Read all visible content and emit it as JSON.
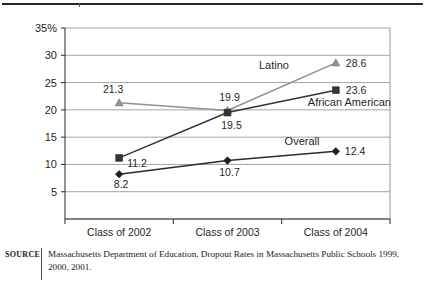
{
  "figure": {
    "source_tag": "SOURCE",
    "source_text": "Massachusetts Department of Education, Dropout Rates in Massachusetts Public Schools 1999, 2000, 2001."
  },
  "chart_data": {
    "type": "line",
    "title": "",
    "xlabel": "",
    "ylabel": "",
    "categories": [
      "Class of 2002",
      "Class of 2003",
      "Class of 2004"
    ],
    "series": [
      {
        "name": "Latino",
        "color": "#8f8f8f",
        "marker": "triangle",
        "values": [
          21.3,
          19.9,
          28.6
        ],
        "point_labels": [
          "21.3",
          "19.9",
          "28.6"
        ]
      },
      {
        "name": "African American",
        "color": "#333333",
        "marker": "square",
        "values": [
          11.2,
          19.5,
          23.6
        ],
        "point_labels": [
          "11.2",
          "19.5",
          "23.6"
        ]
      },
      {
        "name": "Overall",
        "color": "#1f1f1f",
        "marker": "diamond",
        "values": [
          8.2,
          10.7,
          12.4
        ],
        "point_labels": [
          "8.2",
          "10.7",
          "12.4"
        ]
      }
    ],
    "ylim": [
      0,
      35
    ],
    "yticks": [
      5,
      10,
      15,
      20,
      25,
      30,
      35
    ],
    "ytick_labels": [
      "5",
      "10",
      "15",
      "20",
      "25",
      "30",
      "35%"
    ],
    "grid": true,
    "legend": "inline-series-labels",
    "series_labels": [
      "Latino",
      "African American",
      "Overall"
    ]
  }
}
